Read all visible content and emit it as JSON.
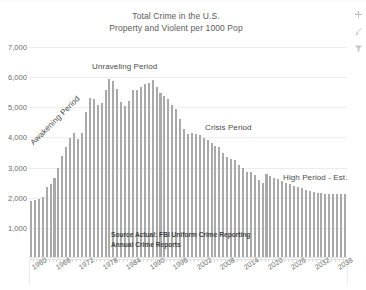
{
  "app": {
    "type": "spreadsheet-embedded-chart",
    "side_buttons": [
      {
        "name": "chart-elements-add-button",
        "glyph": "+",
        "label": "Chart Elements"
      },
      {
        "name": "chart-styles-brush-button",
        "glyph": "brush",
        "label": "Chart Styles"
      },
      {
        "name": "chart-filter-button",
        "glyph": "filter",
        "label": "Chart Filters"
      }
    ]
  },
  "colors": {
    "bar": "#a9a9a9",
    "gridline": "#ededed",
    "axis": "#e2e2e2",
    "text": "#5a5a5a",
    "background": "#ffffff"
  },
  "chart_data": {
    "type": "bar",
    "title": "Total Crime in the U.S.",
    "subtitle": "Property and Violent per 1000 Pop",
    "xlabel": "",
    "ylabel": "",
    "ylim": [
      0,
      7000
    ],
    "ytick_values": [
      1000,
      2000,
      3000,
      4000,
      5000,
      6000,
      7000
    ],
    "ytick_labels": [
      "1,000",
      "2,000",
      "3,000",
      "4,000",
      "5,000",
      "6,000",
      "7,000"
    ],
    "grid": true,
    "legend": null,
    "legend_position": "none",
    "xtick_labels": [
      "1960",
      "1966",
      "1972",
      "1978",
      "1984",
      "1990",
      "1996",
      "2002",
      "2008",
      "2014",
      "2020",
      "2026",
      "2032",
      "2038"
    ],
    "xtick_step_years": 6,
    "x_range": [
      1960,
      2040
    ],
    "categories": [
      1960,
      1961,
      1962,
      1963,
      1964,
      1965,
      1966,
      1967,
      1968,
      1969,
      1970,
      1971,
      1972,
      1973,
      1974,
      1975,
      1976,
      1977,
      1978,
      1979,
      1980,
      1981,
      1982,
      1983,
      1984,
      1985,
      1986,
      1987,
      1988,
      1989,
      1990,
      1991,
      1992,
      1993,
      1994,
      1995,
      1996,
      1997,
      1998,
      1999,
      2000,
      2001,
      2002,
      2003,
      2004,
      2005,
      2006,
      2007,
      2008,
      2009,
      2010,
      2011,
      2012,
      2013,
      2014,
      2015,
      2016,
      2017,
      2018,
      2019,
      2020,
      2021,
      2022,
      2023,
      2024,
      2025,
      2026,
      2027,
      2028,
      2029,
      2030,
      2031,
      2032,
      2033,
      2034,
      2035,
      2036,
      2037,
      2038,
      2039,
      2040
    ],
    "values": [
      1900,
      1920,
      1960,
      2030,
      2350,
      2450,
      2670,
      2990,
      3370,
      3680,
      3990,
      4160,
      3960,
      4150,
      4850,
      5300,
      5290,
      5080,
      5140,
      5570,
      5950,
      5860,
      5600,
      5180,
      5040,
      5210,
      5560,
      5560,
      5680,
      5780,
      5820,
      5900,
      5660,
      5490,
      5370,
      5280,
      5080,
      4930,
      4620,
      4270,
      4120,
      4160,
      4120,
      4070,
      3980,
      3900,
      3810,
      3730,
      3670,
      3470,
      3350,
      3290,
      3250,
      3100,
      2970,
      2860,
      2840,
      2760,
      2600,
      2490,
      2800,
      2720,
      2660,
      2610,
      2560,
      2500,
      2450,
      2400,
      2350,
      2310,
      2270,
      2230,
      2200,
      2170,
      2150,
      2130,
      2120,
      2110,
      2110,
      2110,
      2110
    ],
    "forecast_start_year": 2020,
    "annotations": [
      {
        "name": "awakening-period-annotation",
        "text": "Awakening Period",
        "rotation": -45
      },
      {
        "name": "unraveling-period-annotation",
        "text": "Unraveling Period",
        "rotation": 0
      },
      {
        "name": "crisis-period-annotation",
        "text": "Crisis Period",
        "rotation": 0
      },
      {
        "name": "high-period-est-annotation",
        "text": "High Period - Est.",
        "rotation": 0
      }
    ],
    "source_note_line1": "Source Actual: FBI Uniform Crime Reporting",
    "source_note_line2": "Annual Crime Reports"
  }
}
